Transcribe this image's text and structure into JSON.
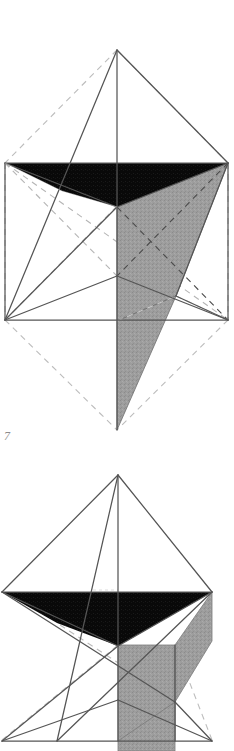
{
  "plate": {
    "title": "Geometric crystal form plate",
    "background_color": "#ffffff",
    "figure_label": "7",
    "label_color": "#8d8d8d",
    "palette": {
      "black_face": "#0a0a0a",
      "gray_face": "#9d9d9d",
      "gray_face_dark": "#8a8a8a",
      "gray_face_light": "#b2b2b2",
      "white_face": "#ffffff",
      "solid_edge": "#4f4f4f",
      "dashed_edge": "#b9b9b9",
      "hidden_edge": "#7d7d7d"
    }
  },
  "figures": [
    {
      "name": "figure-top",
      "caption": "7",
      "description": "Star-tetrahedron / triangular antiprism construction inside a dashed hexagonal bipyramid envelope",
      "viewbox": "0 0 234 445",
      "faces": [
        {
          "name": "top-black-face-left",
          "fill": "#0a0a0a",
          "points": "5,163 117,163 117,206 62,190"
        },
        {
          "name": "top-black-face-right",
          "fill": "#0a0a0a",
          "points": "117,163 228,163 117,206"
        },
        {
          "name": "top-black-wedge",
          "fill": "#0a0a0a",
          "points": "62,190 117,206 117,163"
        },
        {
          "name": "gray-right-face",
          "fill": "#9d9d9d",
          "points": "228,163 117,206 117,320 175,295"
        },
        {
          "name": "gray-lower-spike",
          "fill": "#9d9d9d",
          "points": "117,320 117,430 175,295"
        },
        {
          "name": "gray-small-upper",
          "fill": "#9d9d9d",
          "points": "62,168 92,178 92,190 62,190"
        }
      ],
      "solid_edges": [
        "117,50 117,430",
        "117,50 5,320",
        "117,50 228,163",
        "5,163 228,163",
        "5,320 228,320",
        "5,320 117,206",
        "5,320 175,295",
        "228,320 117,276",
        "117,276 5,320",
        "117,206 228,163",
        "117,206 5,163",
        "117,206 117,430",
        "228,163 175,295",
        "175,295 117,320",
        "5,163 5,320",
        "228,163 228,320"
      ],
      "dashed_edges": [
        "117,50 5,163",
        "117,50 228,163",
        "5,163 5,320",
        "228,163 228,320",
        "5,320 117,430",
        "228,320 117,430",
        "5,163 228,320",
        "228,163 5,320",
        "5,163 117,276",
        "228,163 117,276",
        "117,206 5,320",
        "117,206 228,320"
      ]
    },
    {
      "name": "figure-bottom",
      "caption": "",
      "description": "Second orientation of the same star-tetrahedron, cropped at the page edge",
      "viewbox": "0 0 234 291",
      "faces": [
        {
          "name": "bottom-black-face-left",
          "fill": "#0a0a0a",
          "points": "2,592 117,592 117,645 57,622"
        },
        {
          "name": "bottom-black-face-right",
          "fill": "#0a0a0a",
          "points": "117,592 212,592 117,645"
        },
        {
          "name": "bottom-gray-vertical",
          "fill": "#a3a3a3",
          "points": "117,645 175,645 175,740 117,740"
        },
        {
          "name": "bottom-gray-right-wedge",
          "fill": "#9d9d9d",
          "points": "212,592 175,645 175,700 212,640"
        },
        {
          "name": "bottom-gray-small-left",
          "fill": "#a8a8a8",
          "points": "57,592 92,605 92,622 57,622"
        },
        {
          "name": "bottom-gray-lower-spike",
          "fill": "#9d9d9d",
          "points": "117,740 175,700 175,751 117,751"
        }
      ],
      "solid_edges": [
        "118,475 118,740",
        "118,475 2,592",
        "118,475 212,592",
        "118,475 57,740",
        "2,592 212,592",
        "2,740 212,740",
        "2,592 175,700",
        "212,592 57,740",
        "2,740 118,645",
        "118,645 212,592",
        "118,645 2,592",
        "118,645 118,751",
        "175,645 175,740",
        "2,740 175,700",
        "212,740 118,700"
      ],
      "dashed_edges": [
        "2,592 118,700",
        "212,592 118,700",
        "2,740 118,645",
        "212,740 175,645",
        "57,622 175,645",
        "2,592 175,740"
      ]
    }
  ]
}
